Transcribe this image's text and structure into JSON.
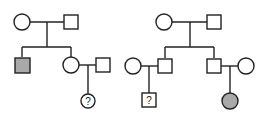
{
  "diagram": {
    "type": "pedigree",
    "colors": {
      "line": "#222222",
      "unaffected": "#ffffff",
      "affected": "#a9a9a9"
    },
    "pedigrees": [
      {
        "id": "left",
        "generation1": [
          {
            "sex": "female",
            "affected": false
          },
          {
            "sex": "male",
            "affected": false
          }
        ],
        "generation2": [
          {
            "sex": "male",
            "affected": true
          },
          {
            "sex": "female",
            "affected": false,
            "spouse": {
              "sex": "male",
              "affected": false
            }
          }
        ],
        "generation3": [
          {
            "sex": "female",
            "affected": "unknown",
            "label": "?"
          }
        ]
      },
      {
        "id": "right",
        "generation1": [
          {
            "sex": "female",
            "affected": false
          },
          {
            "sex": "male",
            "affected": false
          }
        ],
        "generation2": [
          {
            "sex": "male",
            "affected": false,
            "spouse": {
              "sex": "female",
              "affected": false
            }
          },
          {
            "sex": "male",
            "affected": false,
            "spouse": {
              "sex": "female",
              "affected": false
            }
          }
        ],
        "generation3": [
          {
            "sex": "male",
            "affected": "unknown",
            "label": "?"
          },
          {
            "sex": "female",
            "affected": true
          }
        ]
      }
    ]
  }
}
